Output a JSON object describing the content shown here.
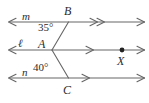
{
  "figure": {
    "background_color": "#ffffff",
    "stroke_color": "#555555",
    "text_color": "#2b2b2b"
  },
  "lines": [
    {
      "name": "line-m",
      "label": "m",
      "label_x": 22,
      "label_y": 11,
      "y": 22,
      "x_start": 8,
      "x_end": 145,
      "left_arrow": true,
      "right_arrow": true,
      "tick_marker": "double-arrow",
      "tick_x": 95
    },
    {
      "name": "line-l",
      "label": "ℓ",
      "label_x": 18,
      "label_y": 38,
      "y": 50,
      "x_start": 8,
      "x_end": 145,
      "left_arrow": true,
      "right_arrow": true,
      "tick_marker": "single-arrow",
      "tick_x": 92
    },
    {
      "name": "line-n",
      "label": "n",
      "label_x": 22,
      "label_y": 67,
      "y": 78,
      "x_start": 8,
      "x_end": 145,
      "left_arrow": true,
      "right_arrow": true,
      "tick_marker": "single-arrow",
      "tick_x": 88
    }
  ],
  "points": [
    {
      "name": "point-A",
      "label": "A",
      "x": 52,
      "y": 50,
      "label_x": 38,
      "label_y": 38,
      "dot": false
    },
    {
      "name": "point-B",
      "label": "B",
      "x": 68,
      "y": 22,
      "label_x": 64,
      "label_y": 6,
      "dot": false
    },
    {
      "name": "point-C",
      "label": "C",
      "x": 68,
      "y": 78,
      "label_x": 64,
      "label_y": 84,
      "dot": false
    },
    {
      "name": "point-X",
      "label": "X",
      "x": 122,
      "y": 50,
      "label_x": 117,
      "label_y": 54,
      "dot": true
    }
  ],
  "segments": [
    {
      "name": "segment-AB",
      "x1": 52,
      "y1": 50,
      "x2": 68,
      "y2": 22
    },
    {
      "name": "segment-AC",
      "x1": 52,
      "y1": 50,
      "x2": 68,
      "y2": 78
    }
  ],
  "angles": [
    {
      "name": "angle-BAL",
      "label": "35°",
      "value": 35,
      "unit": "degrees",
      "label_x": 38,
      "label_y": 22
    },
    {
      "name": "angle-CAL",
      "label": "40°",
      "value": 40,
      "unit": "degrees",
      "label_x": 33,
      "label_y": 63
    }
  ]
}
